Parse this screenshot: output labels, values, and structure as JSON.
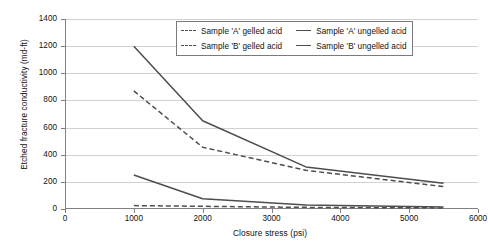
{
  "chart_data": {
    "type": "line",
    "title": "",
    "xlabel": "Closure stress (psi)",
    "ylabel": "Etched fracture conductivity (md-ft)",
    "xlim": [
      0,
      6000
    ],
    "ylim": [
      0,
      1400
    ],
    "xticks": [
      "0",
      "1000",
      "2000",
      "3000",
      "4000",
      "5000",
      "6000"
    ],
    "yticks": [
      "0",
      "200",
      "400",
      "600",
      "800",
      "1000",
      "1200",
      "1400"
    ],
    "grid": "horizontal",
    "legend_position": "top-center",
    "x": [
      1000,
      2000,
      3500,
      5500
    ],
    "series": [
      {
        "name": "Sample 'A' gelled acid",
        "style": "dashed",
        "color": "#4d4d4d",
        "values": [
          870,
          455,
          285,
          165
        ]
      },
      {
        "name": "Sample 'A' ungelled acid",
        "style": "solid",
        "color": "#4d4d4d",
        "values": [
          250,
          75,
          30,
          15
        ]
      },
      {
        "name": "Sample 'B' gelled acid",
        "style": "dashed",
        "color": "#4d4d4d",
        "values": [
          25,
          20,
          12,
          8
        ]
      },
      {
        "name": "Sample 'B' ungelled acid",
        "style": "solid",
        "color": "#4d4d4d",
        "values": [
          1200,
          650,
          310,
          190
        ]
      }
    ]
  },
  "legend": {
    "entries": [
      {
        "label": "Sample 'A' gelled acid",
        "style": "dashed"
      },
      {
        "label": "Sample 'A' ungelled acid",
        "style": "solid"
      },
      {
        "label": "Sample 'B' gelled acid",
        "style": "dashed"
      },
      {
        "label": "Sample 'B' ungelled acid",
        "style": "solid"
      }
    ]
  }
}
